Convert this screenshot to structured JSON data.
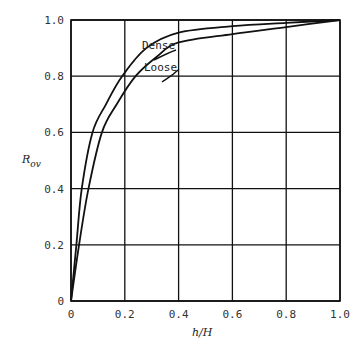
{
  "chart_data": {
    "type": "line",
    "title": "",
    "xlabel": "h/H",
    "ylabel": "R_ov",
    "xlim": [
      0,
      1.0
    ],
    "ylim": [
      0,
      1.0
    ],
    "grid": true,
    "legend": "inline labels near curves",
    "x_ticks": [
      "0",
      "0.2",
      "0.4",
      "0.6",
      "0.8",
      "1.0"
    ],
    "y_ticks": [
      "0",
      "0.2",
      "0.4",
      "0.6",
      "0.8",
      "1.0"
    ],
    "series": [
      {
        "name": "Dense",
        "x": [
          0,
          0.02,
          0.04,
          0.08,
          0.13,
          0.19,
          0.28,
          0.4,
          0.6,
          0.8,
          1.0
        ],
        "y": [
          0,
          0.2,
          0.4,
          0.6,
          0.7,
          0.8,
          0.9,
          0.955,
          0.978,
          0.99,
          1.0
        ]
      },
      {
        "name": "Loose",
        "x": [
          0,
          0.03,
          0.065,
          0.115,
          0.17,
          0.24,
          0.32,
          0.4,
          0.6,
          0.8,
          1.0
        ],
        "y": [
          0,
          0.2,
          0.4,
          0.6,
          0.7,
          0.8,
          0.87,
          0.92,
          0.95,
          0.975,
          1.0
        ]
      }
    ],
    "annotations": [
      {
        "text": "Dense",
        "x": 0.27,
        "y": 0.92
      },
      {
        "text": "Loose",
        "x": 0.29,
        "y": 0.84
      }
    ]
  },
  "labels": {
    "xlabel_main": "h/H",
    "ylabel_main": "R",
    "ylabel_sub": "ov",
    "dense": "Dense",
    "loose": "Loose"
  }
}
